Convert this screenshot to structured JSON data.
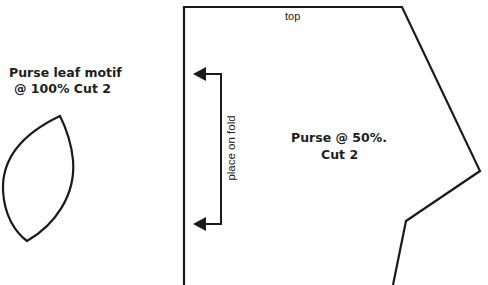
{
  "leaf_pattern": {
    "title": "Purse leaf motif",
    "subtitle": "@ 100% Cut 2"
  },
  "purse_pattern": {
    "title": "Purse @ 50%.",
    "subtitle": "Cut 2",
    "edge_label": "top",
    "fold_label": "place on fold"
  },
  "colors": {
    "line": "#1a1a1a",
    "background": "#ffffff"
  }
}
